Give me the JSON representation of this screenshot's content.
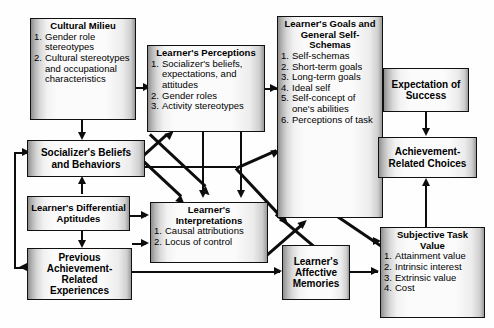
{
  "diagram": {
    "boxes": {
      "cultural_milieu": {
        "title": "Cultural Milieu",
        "items": [
          {
            "n": "1.",
            "text": "Gender role stereotypes"
          },
          {
            "n": "2.",
            "text": "Cultural stereotypes and occupational characteristics"
          }
        ]
      },
      "learners_perceptions": {
        "title": "Learner's Perceptions",
        "items": [
          {
            "n": "1.",
            "text": "Socializer's beliefs, expectations, and attitudes"
          },
          {
            "n": "2.",
            "text": "Gender roles"
          },
          {
            "n": "3.",
            "text": "Activity stereotypes"
          }
        ]
      },
      "learners_goals": {
        "title": "Learner's Goals and General Self-Schemas",
        "items": [
          {
            "n": "1.",
            "text": "Self-schemas"
          },
          {
            "n": "2.",
            "text": "Short-term goals"
          },
          {
            "n": "3.",
            "text": "Long-term goals"
          },
          {
            "n": "4.",
            "text": "Ideal self"
          },
          {
            "n": "5.",
            "text": "Self-concept of one's abilities"
          },
          {
            "n": "6.",
            "text": "Perceptions of task"
          }
        ]
      },
      "expectation_of_success": {
        "title": "Expectation of Success",
        "items": []
      },
      "achievement_related_choices": {
        "title": "Achievement-Related Choices",
        "items": []
      },
      "socializers_beliefs": {
        "title": "Socializer's Beliefs and Behaviors",
        "items": []
      },
      "learners_differential_aptitudes": {
        "title": "Learner's Differential Aptitudes",
        "items": []
      },
      "previous_achievement": {
        "title": "Previous Achievement-Related Experiences",
        "items": []
      },
      "learners_interpretations": {
        "title": "Learner's Interpretations",
        "items": [
          {
            "n": "1.",
            "text": "Causal attributions"
          },
          {
            "n": "2.",
            "text": "Locus of control"
          }
        ]
      },
      "learners_affective_memories": {
        "title": "Learner's Affective Memories",
        "items": []
      },
      "subjective_task_value": {
        "title": "Subjective Task Value",
        "items": [
          {
            "n": "1.",
            "text": "Attainment value"
          },
          {
            "n": "2.",
            "text": "Intrinsic interest"
          },
          {
            "n": "3.",
            "text": "Extrinsic value"
          },
          {
            "n": "4.",
            "text": "Cost"
          }
        ]
      }
    },
    "colors": {
      "line": "#0d0d0d",
      "border": "#111111",
      "box_light": "#fbfbfb",
      "box_shade": "#8e8e8e",
      "background": "#ffffff"
    }
  }
}
